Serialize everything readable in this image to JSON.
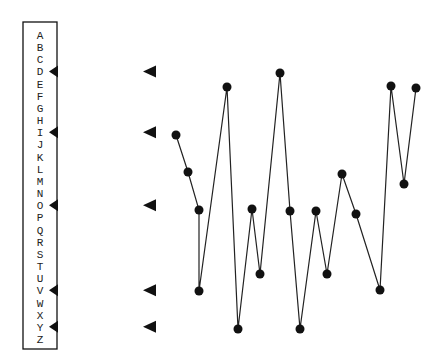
{
  "chart_data": {
    "type": "line",
    "title": "",
    "xlabel": "",
    "ylabel": "",
    "alphabet": [
      "A",
      "B",
      "C",
      "D",
      "E",
      "F",
      "G",
      "H",
      "I",
      "J",
      "K",
      "L",
      "M",
      "N",
      "O",
      "P",
      "Q",
      "R",
      "S",
      "T",
      "U",
      "V",
      "W",
      "X",
      "Y",
      "Z"
    ],
    "marked_letters": [
      "D",
      "I",
      "O",
      "V",
      "Y"
    ],
    "x": [
      1,
      2,
      3,
      4,
      5,
      6,
      7,
      8,
      9,
      10,
      11,
      12,
      13,
      14,
      15,
      16,
      17,
      18,
      19
    ],
    "series": [
      {
        "name": "letter sequence",
        "values": [
          "I",
          "L",
          "O",
          "V",
          "E",
          "Y",
          "O",
          "U",
          "D",
          "O",
          "Y",
          "O",
          "U",
          "L",
          "O",
          "V",
          "E",
          "M",
          "E"
        ],
        "points_px": [
          [
            176,
            135
          ],
          [
            188,
            172
          ],
          [
            199,
            210
          ],
          [
            199,
            291
          ],
          [
            227,
            87
          ],
          [
            238,
            329
          ],
          [
            252,
            209
          ],
          [
            260,
            274
          ],
          [
            280,
            73
          ],
          [
            290,
            211
          ],
          [
            300,
            329
          ],
          [
            316,
            211
          ],
          [
            327,
            274
          ],
          [
            342,
            174
          ],
          [
            356,
            214
          ],
          [
            380,
            290
          ],
          [
            391,
            86
          ],
          [
            404,
            184
          ],
          [
            416,
            88
          ]
        ]
      }
    ],
    "grid": false,
    "legend": false
  },
  "colors": {
    "ink": "#111111",
    "background": "#ffffff"
  }
}
